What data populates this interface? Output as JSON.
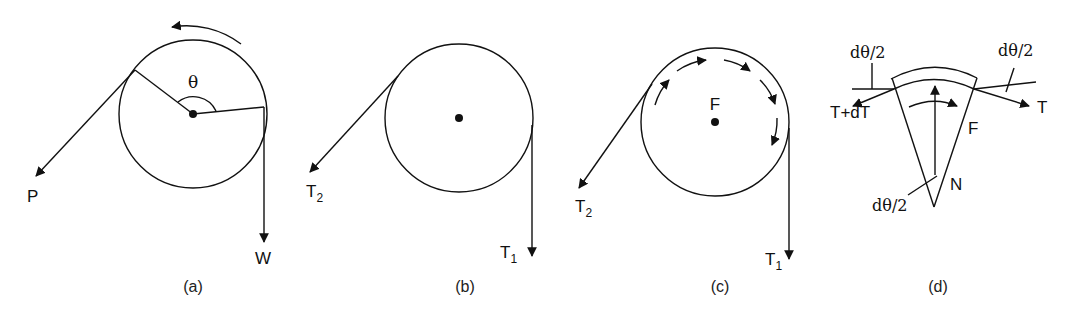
{
  "figure": {
    "panels": [
      {
        "id": "a",
        "caption": "(a)",
        "labels": {
          "angle": "θ",
          "left_force": "P",
          "right_force": "W"
        },
        "description": "Pulley with rope wrapped over angle θ; force P pulls at lower left, weight W hangs down on right; rotation arrow counterclockwise above"
      },
      {
        "id": "b",
        "caption": "(b)",
        "labels": {
          "left_tension": "T",
          "left_tension_sub": "2",
          "right_tension": "T",
          "right_tension_sub": "1"
        },
        "description": "Pulley with tensions T2 (lower left) and T1 (down right)"
      },
      {
        "id": "c",
        "caption": "(c)",
        "labels": {
          "friction": "F",
          "left_tension": "T",
          "left_tension_sub": "2",
          "right_tension": "T",
          "right_tension_sub": "1"
        },
        "description": "Pulley with distributed friction arrows F along contact arc, tensions T2 and T1"
      },
      {
        "id": "d",
        "caption": "(d)",
        "labels": {
          "angle_top_left": "dθ/2",
          "angle_top_right": "dθ/2",
          "angle_bottom": "dθ/2",
          "left_tension": "T+dT",
          "right_tension": "T",
          "friction": "F",
          "normal": "N"
        },
        "description": "Differential rope element free body diagram with tensions T and T+dT, normal force N, friction F"
      }
    ]
  }
}
